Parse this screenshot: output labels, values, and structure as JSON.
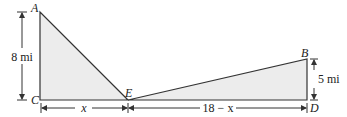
{
  "diagram": {
    "points": {
      "A": {
        "label": "A",
        "x": 40,
        "y": 12
      },
      "C": {
        "label": "C",
        "x": 40,
        "y": 100
      },
      "E": {
        "label": "E",
        "x": 128,
        "y": 100
      },
      "B": {
        "label": "B",
        "x": 307,
        "y": 59
      },
      "D": {
        "label": "D",
        "x": 307,
        "y": 100
      }
    },
    "dimensions": {
      "AC": "8 mi",
      "BD": "5 mi",
      "CE": "x",
      "ED": "18 − x"
    },
    "colors": {
      "fill": "#ececec",
      "stroke": "#333333"
    }
  }
}
